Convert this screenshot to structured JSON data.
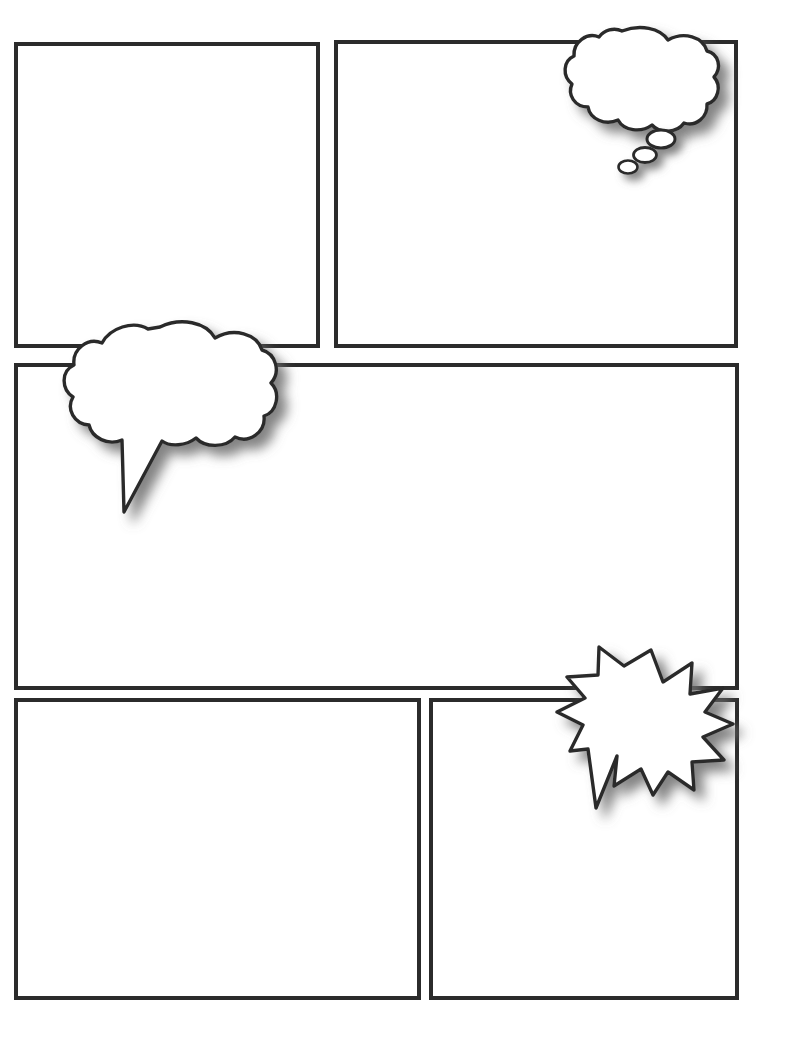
{
  "page": {
    "kind": "comic-page-template",
    "width": 790,
    "height": 1059,
    "background_color": "#ffffff",
    "ink_color": "#2b2b2b",
    "shadow_color": "#808080",
    "panel_fill": "#ffffff",
    "panel_border_width": 4
  },
  "panels": [
    {
      "id": "panel-1",
      "label": "",
      "row": 1,
      "column": 1,
      "x": 16,
      "y": 44,
      "width": 302,
      "height": 302
    },
    {
      "id": "panel-2",
      "label": "",
      "row": 1,
      "column": 2,
      "x": 336,
      "y": 42,
      "width": 400,
      "height": 304
    },
    {
      "id": "panel-3",
      "label": "",
      "row": 2,
      "column": 1,
      "x": 16,
      "y": 365,
      "width": 721,
      "height": 323
    },
    {
      "id": "panel-4",
      "label": "",
      "row": 3,
      "column": 1,
      "x": 16,
      "y": 700,
      "width": 403,
      "height": 298
    },
    {
      "id": "panel-5",
      "label": "",
      "row": 3,
      "column": 2,
      "x": 431,
      "y": 700,
      "width": 306,
      "height": 298
    }
  ],
  "balloons": [
    {
      "id": "thought-balloon",
      "type": "thought",
      "text": "",
      "attached_panel": "panel-2",
      "x": 563,
      "y": 28,
      "width": 155,
      "height": 105,
      "tail_style": "three-descending-bubbles",
      "tail_direction": "down-left",
      "dots": 3
    },
    {
      "id": "speech-balloon",
      "type": "speech",
      "text": "",
      "attached_panel": "panel-3",
      "x": 70,
      "y": 320,
      "width": 200,
      "height": 130,
      "tail_style": "pointed-tail",
      "tail_direction": "down-left"
    },
    {
      "id": "burst-balloon",
      "type": "burst",
      "text": "",
      "attached_panel": "panel-5",
      "x": 570,
      "y": 648,
      "width": 162,
      "height": 145,
      "tail_style": "jagged-spike-tail",
      "tail_direction": "down-left",
      "spikes": 13
    }
  ]
}
